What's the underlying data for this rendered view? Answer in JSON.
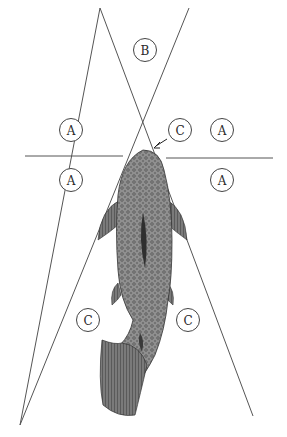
{
  "diagram": {
    "zone_labels": {
      "b": "B",
      "a_upper_left": "A",
      "a_lower_left": "A",
      "a_upper_right": "A",
      "a_lower_right": "A",
      "c_arrow": "C",
      "c_lower_left": "C",
      "c_lower_right": "C"
    },
    "colors": {
      "line": "#555555",
      "fish_body": "#8a8a8a",
      "fish_dark": "#4a4a4a",
      "background": "#ffffff"
    }
  }
}
